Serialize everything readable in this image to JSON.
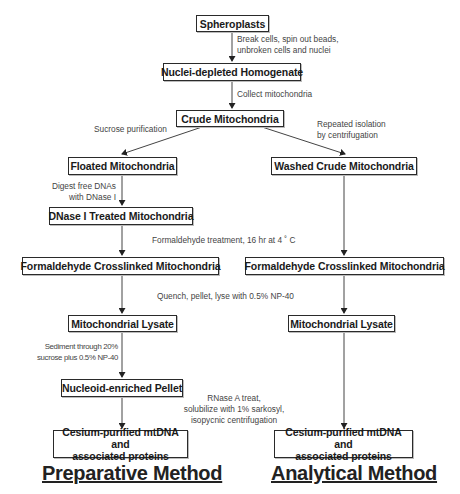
{
  "diagram": {
    "nodes": {
      "spheroplasts": "Spheroplasts",
      "homogenate": "Nuclei-depleted Homogenate",
      "crude": "Crude Mitochondria",
      "floated": "Floated Mitochondria",
      "washed": "Washed Crude Mitochondria",
      "dnase": "DNase I Treated Mitochondria",
      "crosslinked_left": "Formaldehyde Crosslinked Mitochondria",
      "crosslinked_right": "Formaldehyde Crosslinked Mitochondria",
      "lysate_left": "Mitochondrial Lysate",
      "lysate_right": "Mitochondrial Lysate",
      "pellet": "Nucleoid-enriched Pellet",
      "cesium_left_line1": "Cesium-purified mtDNA and",
      "cesium_left_line2": "associated proteins",
      "cesium_right_line1": "Cesium-purified mtDNA and",
      "cesium_right_line2": "associated proteins"
    },
    "steps": {
      "break_cells_line1": "Break cells, spin out beads,",
      "break_cells_line2": "unbroken cells and nuclei",
      "collect": "Collect mitochondria",
      "sucrose": "Sucrose purification",
      "repeated_line1": "Repeated isolation",
      "repeated_line2": "by centrifugation",
      "digest_line1": "Digest free DNAs",
      "digest_line2": "with DNase I",
      "formaldehyde": "Formaldehyde treatment, 16 hr at 4 ˚ C",
      "quench": "Quench, pellet, lyse with 0.5% NP-40",
      "sediment_line1": "Sediment through 20%",
      "sediment_line2": "sucrose plus 0.5% NP-40",
      "rnase_line1": "RNase A treat,",
      "rnase_line2": "solubilize with 1% sarkosyl,",
      "rnase_line3": "isopycnic centrifugation"
    },
    "methods": {
      "left": "Preparative Method",
      "right": "Analytical Method"
    }
  }
}
